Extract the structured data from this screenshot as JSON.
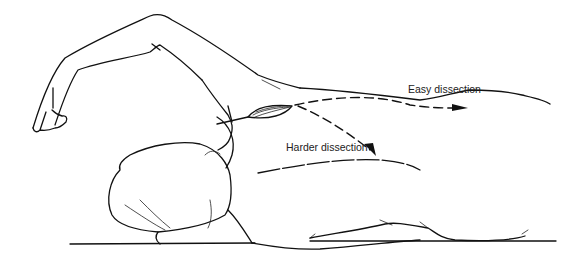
{
  "figure": {
    "labels": {
      "easy": "Easy dissection",
      "hard": "Harder dissection"
    },
    "colors": {
      "line": "#111111",
      "background": "#ffffff"
    }
  }
}
